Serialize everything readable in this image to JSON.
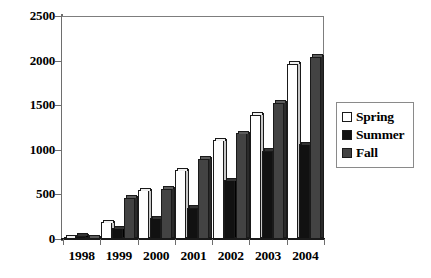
{
  "chart_data": {
    "type": "bar",
    "title": "",
    "subtitle": "",
    "xlabel": "",
    "ylabel": "",
    "categories": [
      "1998",
      "1999",
      "2000",
      "2001",
      "2002",
      "2003",
      "2004"
    ],
    "series": [
      {
        "name": "Spring",
        "color": "#ffffff",
        "values": [
          10,
          190,
          545,
          770,
          1110,
          1395,
          1965
        ]
      },
      {
        "name": "Summer",
        "color": "#111111",
        "values": [
          35,
          120,
          230,
          350,
          660,
          990,
          1065
        ]
      },
      {
        "name": "Fall",
        "color": "#434343",
        "values": [
          10,
          465,
          565,
          900,
          1185,
          1525,
          2045
        ]
      }
    ],
    "ylim": [
      0,
      2500
    ],
    "ytick_labels": [
      "0",
      "500",
      "1000",
      "1500",
      "2000",
      "2500"
    ],
    "ytick_values": [
      0,
      500,
      1000,
      1500,
      2000,
      2500
    ],
    "grid": true,
    "legend_position": "right",
    "orientation": "vertical",
    "grouping": "clustered"
  },
  "legend": {
    "items": [
      {
        "label": "Spring",
        "swatch": "legend-swatch-spring"
      },
      {
        "label": "Summer",
        "swatch": "legend-swatch-summer"
      },
      {
        "label": "Fall",
        "swatch": "legend-swatch-fall"
      }
    ]
  }
}
